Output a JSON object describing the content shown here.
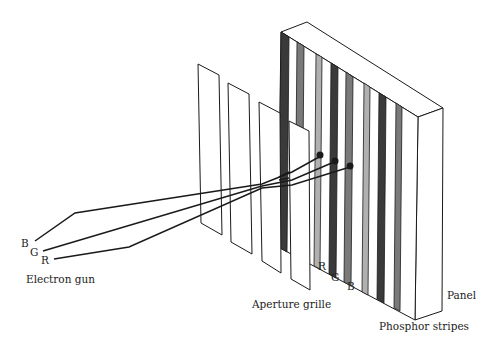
{
  "diagram": {
    "labels": {
      "electron_gun": "Electron gun",
      "aperture_grille": "Aperture grille",
      "phosphor_stripes": "Phosphor stripes",
      "panel": "Panel",
      "beam_b": "B",
      "beam_g": "G",
      "beam_r": "R",
      "stripe_r": "R",
      "stripe_g": "G",
      "stripe_b": "B"
    },
    "colors": {
      "stroke": "#1a1a1a",
      "stripe_dark": "#3a3a3a",
      "stripe_mid": "#7a7a7a",
      "stripe_light": "#b0b0b0",
      "background": "#ffffff"
    }
  }
}
